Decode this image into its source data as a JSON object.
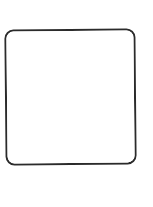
{
  "image": {
    "description": "blank rounded-square outline",
    "width": 153,
    "height": 207,
    "background_color": "#ffffff"
  },
  "frame": {
    "name": "rounded-square-outline",
    "label": "",
    "shape": "rounded-rectangle",
    "stroke_color": "#2b2b2b",
    "stroke_width_px": 2,
    "corner_radius_px": 9,
    "fill_color": "#ffffff",
    "rotation_deg": -0.55,
    "left_px": 5,
    "top_px": 29,
    "width_px": 131,
    "height_px": 136
  },
  "interior": {
    "name": "empty-content-area",
    "content": "",
    "fill_color": "#ffffff"
  },
  "margins": {
    "top_px": 29,
    "bottom_px": 42,
    "left_px": 5,
    "right_px": 17,
    "color": "#ffffff"
  }
}
